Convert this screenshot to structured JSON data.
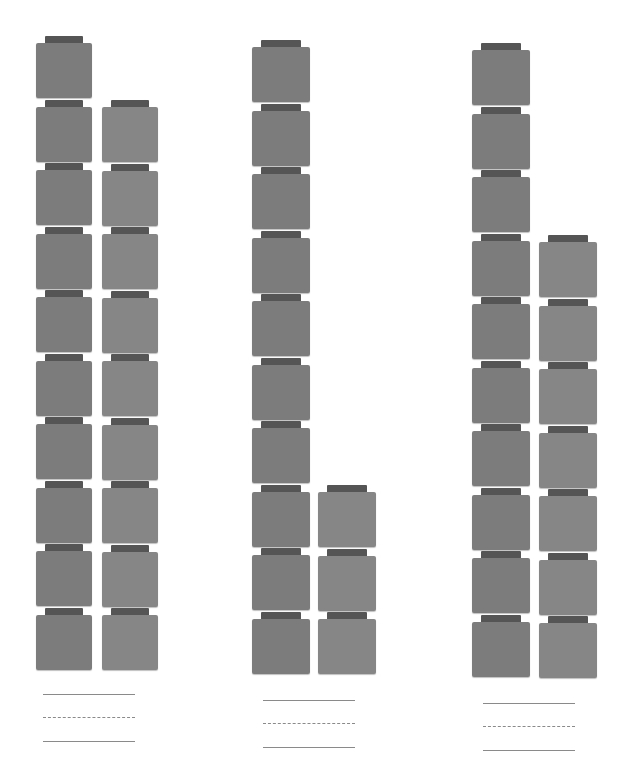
{
  "worksheet": {
    "type": "base-ten-blocks-counting",
    "colors": {
      "block_face_tens": "#7c7c7c",
      "block_face_ones": "#868686",
      "connector": "#555555",
      "writing_line": "#8a8a8a"
    },
    "groups": [
      {
        "id": "group-1",
        "tens": 1,
        "ones": 9,
        "tens_rod_cubes": 10,
        "ones_cubes": 9,
        "total": 19,
        "answer_lines": 3
      },
      {
        "id": "group-2",
        "tens": 1,
        "ones": 3,
        "tens_rod_cubes": 10,
        "ones_cubes": 3,
        "total": 13,
        "answer_lines": 3
      },
      {
        "id": "group-3",
        "tens": 1,
        "ones": 7,
        "tens_rod_cubes": 10,
        "ones_cubes": 7,
        "total": 17,
        "answer_lines": 3
      }
    ]
  },
  "layout": [
    {
      "tens_col": {
        "left": 36,
        "top": 36,
        "width": 56
      },
      "ones_col": {
        "left": 102,
        "top": 100,
        "width": 56
      },
      "lines": {
        "left": 43,
        "top": 694
      }
    },
    {
      "tens_col": {
        "left": 252,
        "top": 40,
        "width": 58
      },
      "ones_col": {
        "left": 318,
        "top": 485,
        "width": 58
      },
      "lines": {
        "left": 263,
        "top": 700
      }
    },
    {
      "tens_col": {
        "left": 472,
        "top": 43,
        "width": 58
      },
      "ones_col": {
        "left": 539,
        "top": 235,
        "width": 58
      },
      "lines": {
        "left": 483,
        "top": 703
      }
    }
  ]
}
